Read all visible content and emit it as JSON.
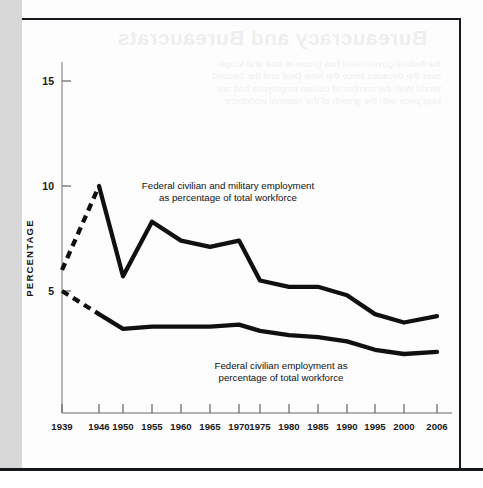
{
  "page": {
    "bleed_through_title": "Bureaucracy and Bureaucrats",
    "bleed_through_lines": [
      "the federal government has grown in size and scope",
      "over the decades since the New Deal and the Second",
      "World War, the number of civilian employees has not",
      "kept pace with the growth of the national workforce."
    ]
  },
  "chart_data": {
    "type": "line",
    "title": "",
    "xlabel": "",
    "ylabel": "PERCENTAGE",
    "x": [
      1939,
      1946,
      1950,
      1955,
      1960,
      1965,
      1970,
      1975,
      1980,
      1985,
      1990,
      1995,
      2000,
      2006
    ],
    "xticklabels": [
      "1939",
      "1946",
      "1950",
      "1955",
      "1960",
      "1965",
      "1970",
      "1975",
      "1980",
      "1985",
      "1990",
      "1995",
      "2000",
      "2006"
    ],
    "yticks": [
      5,
      10,
      15
    ],
    "yticklabels": [
      "5",
      "10",
      "15"
    ],
    "ylim": [
      0,
      16.5
    ],
    "xlim": [
      1939,
      2006
    ],
    "grid": false,
    "legend_position": "inline-annotations",
    "series": [
      {
        "name": "Federal civilian and military employment as percentage of total workforce",
        "values": [
          6.0,
          10.0,
          5.7,
          8.3,
          7.4,
          7.1,
          7.4,
          5.5,
          5.2,
          5.2,
          4.8,
          3.9,
          3.5,
          3.8
        ],
        "dashed_from": 1939,
        "dashed_to": 1946,
        "color": "#101010"
      },
      {
        "name": "Federal civilian employment as percentage of total workforce",
        "values": [
          5.0,
          3.9,
          3.2,
          3.3,
          3.3,
          3.3,
          3.4,
          3.1,
          2.9,
          2.8,
          2.6,
          2.2,
          2.0,
          2.1
        ],
        "dashed_from": 1939,
        "dashed_to": 1946,
        "color": "#101010"
      }
    ],
    "annotations": [
      {
        "id": "annotation-upper",
        "line1": "Federal civilian and military employment",
        "line2": "as percentage of total workforce"
      },
      {
        "id": "annotation-lower",
        "line1": "Federal civilian employment as",
        "line2": "percentage of total workforce"
      }
    ]
  }
}
